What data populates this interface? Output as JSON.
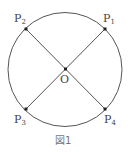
{
  "figure": {
    "caption": "図1",
    "center_label": "O",
    "points": [
      {
        "name": "P",
        "sub": "1"
      },
      {
        "name": "P",
        "sub": "2"
      },
      {
        "name": "P",
        "sub": "3"
      },
      {
        "name": "P",
        "sub": "4"
      }
    ],
    "colors": {
      "stroke": "#555555",
      "point": "#222222",
      "text": "#444444"
    }
  }
}
